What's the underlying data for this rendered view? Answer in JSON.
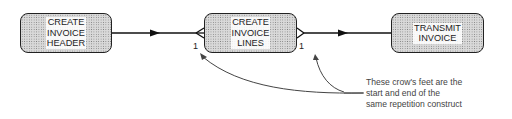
{
  "diagram": {
    "boxes": [
      {
        "id": "create-invoice-header",
        "label": "CREATE\nINVOICE\nHEADER"
      },
      {
        "id": "create-invoice-lines",
        "label": "CREATE\nINVOICE\nLINES"
      },
      {
        "id": "transmit-invoice",
        "label": "TRANSMIT\nINVOICE"
      }
    ],
    "multiplicities": {
      "start": "1",
      "end": "1"
    },
    "annotation": "These crow's feet are the\nstart and end of the\nsame repetition construct",
    "colors": {
      "line": "#111111",
      "box_fill": "#d9d9d9",
      "text": "#222222"
    }
  }
}
